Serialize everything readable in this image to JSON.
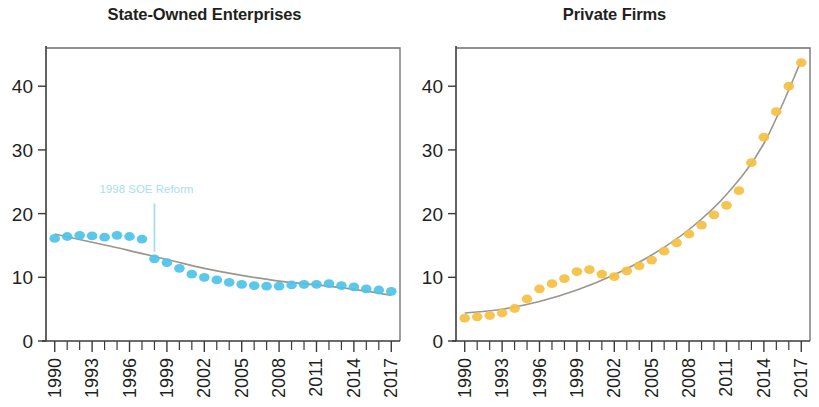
{
  "figure": {
    "width": 819,
    "height": 407,
    "background": "#ffffff"
  },
  "chart_data": [
    {
      "type": "scatter",
      "id": "state-owned-enterprises",
      "title": "State-Owned Enterprises",
      "xlabel": "",
      "ylabel": "",
      "xlim": [
        1989.3,
        2017.7
      ],
      "ylim": [
        0,
        46
      ],
      "yticks": [
        0,
        10,
        20,
        30,
        40
      ],
      "ytick_labels": [
        "0",
        "10",
        "20",
        "30",
        "40"
      ],
      "xticks": [
        1990,
        1991,
        1992,
        1993,
        1994,
        1995,
        1996,
        1997,
        1998,
        1999,
        2000,
        2001,
        2002,
        2003,
        2004,
        2005,
        2006,
        2007,
        2008,
        2009,
        2010,
        2011,
        2012,
        2013,
        2014,
        2015,
        2016,
        2017
      ],
      "xtick_labels_shown": [
        "1990",
        "1993",
        "1996",
        "1999",
        "2002",
        "2005",
        "2008",
        "2011",
        "2014",
        "2017"
      ],
      "xtick_label_rotation": -90,
      "grid": false,
      "legend": false,
      "marker_color": "#4fc3e9",
      "trend_color": "#9b968f",
      "x": [
        1990,
        1991,
        1992,
        1993,
        1994,
        1995,
        1996,
        1997,
        1998,
        1999,
        2000,
        2001,
        2002,
        2003,
        2004,
        2005,
        2006,
        2007,
        2008,
        2009,
        2010,
        2011,
        2012,
        2013,
        2014,
        2015,
        2016,
        2017
      ],
      "values": [
        16.1,
        16.4,
        16.6,
        16.5,
        16.3,
        16.6,
        16.4,
        16.0,
        12.9,
        12.3,
        11.4,
        10.5,
        10.0,
        9.6,
        9.2,
        8.9,
        8.7,
        8.6,
        8.6,
        8.8,
        8.9,
        8.9,
        9.0,
        8.7,
        8.5,
        8.2,
        8.0,
        7.8
      ],
      "trend_x": [
        1990,
        1993,
        1996,
        1999,
        2002,
        2005,
        2008,
        2011,
        2014,
        2017
      ],
      "trend_values": [
        16.8,
        15.5,
        14.2,
        12.8,
        11.4,
        10.3,
        9.4,
        8.8,
        8.1,
        7.2
      ],
      "annotations": [
        {
          "label": "1998 SOE Reform",
          "x": 1998,
          "text_y": 23.2,
          "line_y_top": 21.6,
          "line_y_bottom": 14.0,
          "color": "#a9ddf1"
        }
      ]
    },
    {
      "type": "scatter",
      "id": "private-firms",
      "title": "Private Firms",
      "xlabel": "",
      "ylabel": "",
      "xlim": [
        1989.3,
        2017.7
      ],
      "ylim": [
        0,
        46
      ],
      "yticks": [
        0,
        10,
        20,
        30,
        40
      ],
      "ytick_labels": [
        "0",
        "10",
        "20",
        "30",
        "40"
      ],
      "xticks": [
        1990,
        1991,
        1992,
        1993,
        1994,
        1995,
        1996,
        1997,
        1998,
        1999,
        2000,
        2001,
        2002,
        2003,
        2004,
        2005,
        2006,
        2007,
        2008,
        2009,
        2010,
        2011,
        2012,
        2013,
        2014,
        2015,
        2016,
        2017
      ],
      "xtick_labels_shown": [
        "1990",
        "1993",
        "1996",
        "1999",
        "2002",
        "2005",
        "2008",
        "2011",
        "2014",
        "2017"
      ],
      "xtick_label_rotation": -90,
      "grid": false,
      "legend": false,
      "marker_color": "#f5c044",
      "trend_color": "#9b968f",
      "x": [
        1990,
        1991,
        1992,
        1993,
        1994,
        1995,
        1996,
        1997,
        1998,
        1999,
        2000,
        2001,
        2002,
        2003,
        2004,
        2005,
        2006,
        2007,
        2008,
        2009,
        2010,
        2011,
        2012,
        2013,
        2014,
        2015,
        2016,
        2017
      ],
      "values": [
        3.6,
        3.8,
        4.0,
        4.4,
        5.1,
        6.6,
        8.2,
        9.0,
        9.8,
        10.9,
        11.2,
        10.5,
        10.1,
        11.0,
        11.8,
        12.7,
        14.1,
        15.4,
        16.8,
        18.2,
        19.8,
        21.3,
        23.6,
        28.0,
        32.0,
        36.0,
        40.0,
        43.7
      ],
      "trend_x": [
        1990,
        1993,
        1996,
        1999,
        2002,
        2005,
        2008,
        2011,
        2014,
        2017
      ],
      "trend_values": [
        4.4,
        5.0,
        6.2,
        8.0,
        10.4,
        13.5,
        17.5,
        23.0,
        31.0,
        44.0
      ]
    }
  ]
}
